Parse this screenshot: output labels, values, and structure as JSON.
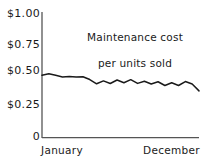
{
  "chart_data": {
    "type": "line",
    "title": "Maintenance cost per units sold",
    "title_line1": "Maintenance cost",
    "title_line2": "per units sold",
    "xlabel": "",
    "ylabel": "",
    "ylim": [
      0,
      1.0
    ],
    "yticks": [
      1.0,
      0.75,
      0.5,
      0.25,
      0
    ],
    "ytick_labels": [
      "$1.00",
      "$0.75",
      "$0.50",
      "$0.25",
      "0"
    ],
    "xtick_labels": [
      "January",
      "December"
    ],
    "grid": false,
    "legend": false,
    "line_color": "#1a1a1a",
    "axis_color": "#555555",
    "x": [
      0,
      1,
      2,
      3,
      4,
      5,
      6,
      7,
      8,
      9,
      10,
      11,
      12,
      13,
      14,
      15,
      16,
      17,
      18,
      19,
      20,
      21,
      22,
      23
    ],
    "values": [
      0.5,
      0.512,
      0.5,
      0.487,
      0.49,
      0.487,
      0.488,
      0.466,
      0.432,
      0.455,
      0.434,
      0.462,
      0.44,
      0.465,
      0.435,
      0.452,
      0.43,
      0.448,
      0.418,
      0.44,
      0.418,
      0.45,
      0.43,
      0.375
    ],
    "series": [
      {
        "name": "Maintenance cost per units sold",
        "values": [
          0.5,
          0.512,
          0.5,
          0.487,
          0.49,
          0.487,
          0.488,
          0.466,
          0.432,
          0.455,
          0.434,
          0.462,
          0.44,
          0.465,
          0.435,
          0.452,
          0.43,
          0.448,
          0.418,
          0.44,
          0.418,
          0.45,
          0.43,
          0.375
        ]
      }
    ]
  },
  "axes": {
    "y_labels": [
      {
        "text": "$1.00",
        "value": 1.0
      },
      {
        "text": "$0.75",
        "value": 0.75
      },
      {
        "text": "$0.50",
        "value": 0.5
      },
      {
        "text": "$0.25",
        "value": 0.25
      },
      {
        "text": "0",
        "value": 0
      }
    ],
    "x_start_label": "January",
    "x_end_label": "December"
  },
  "title": {
    "line1": "Maintenance cost",
    "line2": "per units sold"
  }
}
